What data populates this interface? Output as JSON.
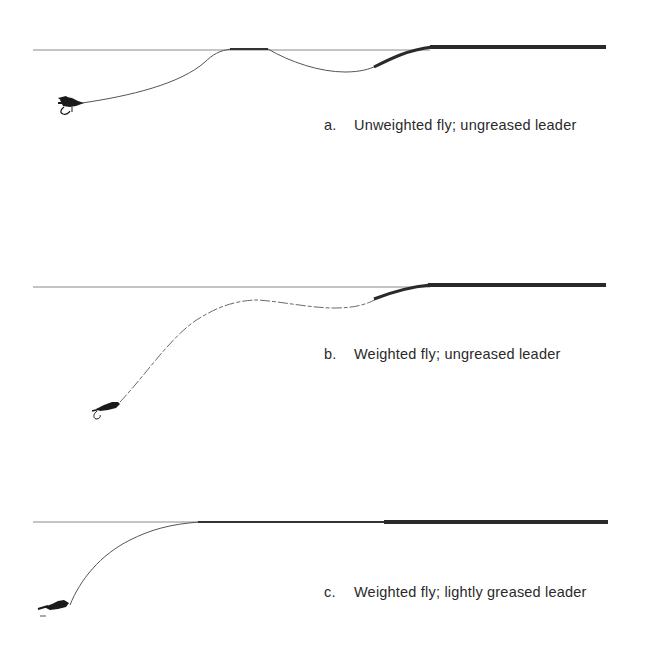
{
  "panels": [
    {
      "letter": "a.",
      "caption": "Unweighted fly; ungreased leader",
      "fly": "unweighted",
      "leader": "ungreased"
    },
    {
      "letter": "b.",
      "caption": "Weighted fly; ungreased leader",
      "fly": "weighted",
      "leader": "ungreased"
    },
    {
      "letter": "c.",
      "caption": "Weighted fly; lightly greased leader",
      "fly": "weighted",
      "leader": "lightly greased"
    }
  ],
  "colors": {
    "surface": "#8a8a8a",
    "leader": "#555555",
    "fly_line": "#2a2a2a",
    "fly": "#1a1a1a",
    "text": "#2a2a2a"
  }
}
